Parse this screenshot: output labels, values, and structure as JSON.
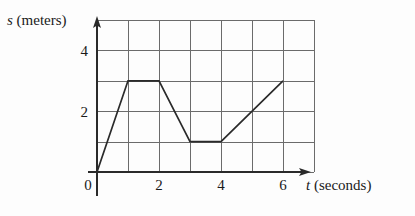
{
  "figure": {
    "background_color": "#fdfdfd",
    "ink_color": "#2a2a2a",
    "grid_color": "#6b6b6b"
  },
  "axis_labels": {
    "y_variable": "s",
    "y_units": " (meters)",
    "x_variable": "t",
    "x_units": " (seconds)"
  },
  "chart_data": {
    "type": "line",
    "title": "",
    "xlabel": "t (seconds)",
    "ylabel": "s (meters)",
    "xlim": [
      0,
      7
    ],
    "ylim": [
      0,
      5
    ],
    "grid": true,
    "legend": "none",
    "x_ticks": [
      0,
      2,
      4,
      6
    ],
    "x_tick_labels": [
      "0",
      "2",
      "4",
      "6"
    ],
    "y_ticks": [
      2,
      4
    ],
    "y_tick_labels": [
      "2",
      "4"
    ],
    "x_gridlines": [
      0,
      1,
      2,
      3,
      4,
      5,
      6,
      7
    ],
    "y_gridlines": [
      0,
      1,
      2,
      3,
      4,
      5
    ],
    "series": [
      {
        "name": "position",
        "x": [
          0,
          1,
          2,
          3,
          4,
          6
        ],
        "values": [
          0,
          3,
          3,
          1,
          1,
          3
        ],
        "points": [
          {
            "t": 0,
            "s": 0
          },
          {
            "t": 1,
            "s": 3
          },
          {
            "t": 2,
            "s": 3
          },
          {
            "t": 3,
            "s": 1
          },
          {
            "t": 4,
            "s": 1
          },
          {
            "t": 6,
            "s": 3
          }
        ]
      }
    ]
  }
}
